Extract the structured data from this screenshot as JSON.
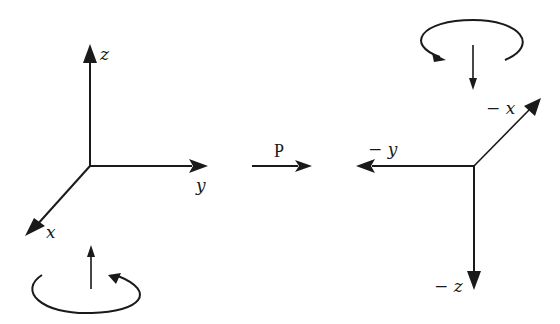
{
  "diagram": {
    "type": "coordinate-transformation",
    "background": "#ffffff",
    "ink_color": "#1a1a1a",
    "left_frame": {
      "axes": [
        {
          "name": "z",
          "label": "z",
          "direction": "up"
        },
        {
          "name": "y",
          "label": "y",
          "direction": "right"
        },
        {
          "name": "x",
          "label": "x",
          "direction": "down-left"
        }
      ],
      "rotation_indicator": {
        "axis_arrow": "up",
        "rotation": "counter-clockwise (viewed from above)"
      }
    },
    "transform": {
      "label": "P",
      "arrow": "right"
    },
    "right_frame": {
      "axes": [
        {
          "name": "neg-x",
          "label": "− x",
          "direction": "up-right"
        },
        {
          "name": "neg-y",
          "label": "− y",
          "direction": "left"
        },
        {
          "name": "neg-z",
          "label": "− z",
          "direction": "down"
        }
      ],
      "rotation_indicator": {
        "axis_arrow": "down",
        "rotation": "clockwise"
      }
    }
  }
}
